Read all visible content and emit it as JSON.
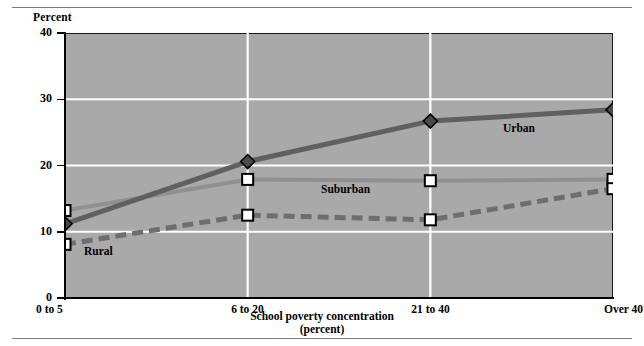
{
  "figure": {
    "has_top_rule": true,
    "has_bottom_rule": true,
    "plot_background": "#a9a9a9",
    "gridline_color": "#ffffff",
    "axis_color": "#000000"
  },
  "labels": {
    "percent_title": "Percent",
    "xaxis_caption_line1": "School poverty concentration",
    "xaxis_caption_line2": "(percent)",
    "urban": "Urban",
    "suburban": "Suburban",
    "rural": "Rural"
  },
  "chart_data": {
    "type": "line",
    "title": "",
    "xlabel": "School poverty concentration (percent)",
    "ylabel": "Percent",
    "categories": [
      "0 to 5",
      "6 to 20",
      "21 to 40",
      "Over 40"
    ],
    "ylim": [
      0,
      40
    ],
    "yticks": [
      0,
      10,
      20,
      30,
      40
    ],
    "ytick_labels": [
      "0",
      "10",
      "20",
      "30",
      "40"
    ],
    "grid": "horizontal-and-vertical",
    "legend": "inline-annotations",
    "series": [
      {
        "name": "Urban",
        "values": [
          11.2,
          20.6,
          26.7,
          28.4
        ],
        "color": "#606060",
        "style": "solid",
        "marker": "diamond",
        "width": 5
      },
      {
        "name": "Suburban",
        "values": [
          13.2,
          17.9,
          17.7,
          17.9
        ],
        "color": "#909090",
        "style": "solid",
        "marker": "open-square",
        "width": 4
      },
      {
        "name": "Rural",
        "values": [
          8.1,
          12.5,
          11.8,
          16.5
        ],
        "color": "#6e6e6e",
        "style": "dashed",
        "marker": "open-square",
        "width": 5
      }
    ]
  }
}
